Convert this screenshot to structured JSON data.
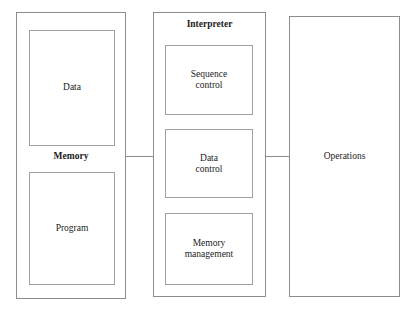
{
  "diagram": {
    "background_color": "#ffffff",
    "line_color": "#8c8c8c",
    "text_color": "#1c1c1c",
    "memory": {
      "caption": "Memory",
      "blocks": [
        {
          "label": "Data"
        },
        {
          "label": "Program"
        }
      ]
    },
    "interpreter": {
      "caption": "Interpreter",
      "blocks": [
        {
          "label": "Sequence\ncontrol"
        },
        {
          "label": "Data\ncontrol"
        },
        {
          "label": "Memory\nmanagement"
        }
      ]
    },
    "operations": {
      "label": "Operations"
    },
    "connectors": [
      {
        "from": "memory",
        "to": "interpreter"
      },
      {
        "from": "interpreter",
        "to": "operations"
      }
    ]
  }
}
